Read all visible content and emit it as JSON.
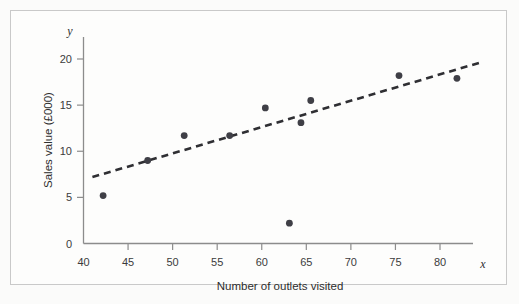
{
  "figure": {
    "background_color": "#fbfbfa",
    "frame_color": "#c9c9c9"
  },
  "chart_data": {
    "type": "scatter",
    "title": "",
    "subtitle": "",
    "xlabel": "Number of outlets visited",
    "ylabel": "Sales value (£000)",
    "x_axis_letter": "x",
    "y_axis_letter": "y",
    "xlim": [
      40,
      84
    ],
    "ylim": [
      0,
      22
    ],
    "xticks": [
      40,
      45,
      50,
      55,
      60,
      65,
      70,
      75,
      80
    ],
    "yticks": [
      0,
      5,
      10,
      15,
      20
    ],
    "xtick_labels": [
      "40",
      "45",
      "50",
      "55",
      "60",
      "65",
      "70",
      "75",
      "80"
    ],
    "ytick_labels": [
      "0",
      "5",
      "10",
      "15",
      "20"
    ],
    "grid": false,
    "legend": null,
    "point_color": "#3f3f46",
    "point_radius": 3.4,
    "x": [
      42.2,
      47.2,
      51.3,
      56.4,
      60.4,
      63.1,
      64.4,
      65.5,
      75.4,
      81.9
    ],
    "y": [
      5.2,
      9.0,
      11.7,
      11.7,
      14.7,
      2.2,
      13.1,
      15.5,
      18.2,
      17.9
    ],
    "points": [
      {
        "x": 42.2,
        "y": 5.2
      },
      {
        "x": 47.2,
        "y": 9.0
      },
      {
        "x": 51.3,
        "y": 11.7
      },
      {
        "x": 56.4,
        "y": 11.7
      },
      {
        "x": 60.4,
        "y": 14.7
      },
      {
        "x": 63.1,
        "y": 2.2
      },
      {
        "x": 64.4,
        "y": 13.1
      },
      {
        "x": 65.5,
        "y": 15.5
      },
      {
        "x": 75.4,
        "y": 18.2
      },
      {
        "x": 81.9,
        "y": 17.9
      }
    ],
    "trend_line": {
      "style": "dashed",
      "color": "#2f2f33",
      "x_start": 41.0,
      "y_start": 7.2,
      "x_end": 84.8,
      "y_end": 19.7
    }
  }
}
